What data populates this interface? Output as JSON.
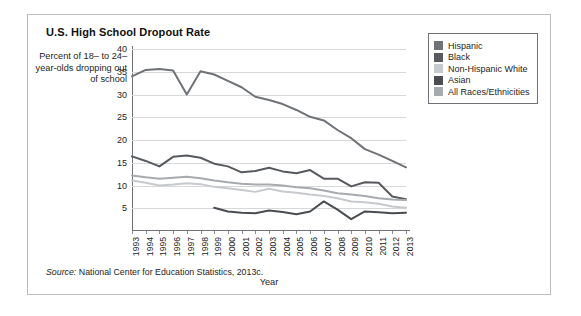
{
  "card": {
    "title": "U.S. High School Dropout Rate",
    "source_prefix": "Source:",
    "source_text": " National Center for Education Statistics, 2013c."
  },
  "chart_data": {
    "type": "line",
    "title": "U.S. High School Dropout Rate",
    "xlabel": "Year",
    "ylabel": "Percent of 18– to 24–year-olds dropping out of school",
    "ylim": [
      0,
      40
    ],
    "yticks": [
      5,
      10,
      15,
      20,
      25,
      30,
      35,
      40
    ],
    "grid": true,
    "legend_position": "right",
    "categories": [
      "1993",
      "1994",
      "1995",
      "1996",
      "1997",
      "1998",
      "1999",
      "2000",
      "2001",
      "2002",
      "2003",
      "2004",
      "2005",
      "2006",
      "2007",
      "2008",
      "2009",
      "2010",
      "2011",
      "2012",
      "2013"
    ],
    "series": [
      {
        "name": "Hispanic",
        "color": "#6f7276",
        "values": [
          34.0,
          35.4,
          35.6,
          35.3,
          30.0,
          35.1,
          34.4,
          33.0,
          31.6,
          29.5,
          28.8,
          27.9,
          26.6,
          25.1,
          24.3,
          22.2,
          20.4,
          18.0,
          16.8,
          15.4,
          14.0
        ]
      },
      {
        "name": "Black",
        "color": "#575a5e",
        "values": [
          16.4,
          15.4,
          14.2,
          16.3,
          16.6,
          16.1,
          14.8,
          14.2,
          12.9,
          13.2,
          13.9,
          13.1,
          12.7,
          13.4,
          11.5,
          11.5,
          9.8,
          10.7,
          10.6,
          7.6,
          7.0
        ]
      },
      {
        "name": "Non-Hispanic White",
        "color": "#c7cacd",
        "values": [
          11.1,
          10.6,
          10.0,
          10.2,
          10.5,
          10.3,
          9.7,
          9.4,
          9.0,
          8.6,
          9.3,
          8.7,
          8.4,
          8.0,
          7.7,
          7.2,
          6.5,
          6.3,
          6.0,
          5.4,
          5.1
        ]
      },
      {
        "name": "Asian",
        "color": "#4a4d51",
        "values": [
          null,
          null,
          null,
          null,
          null,
          null,
          5.1,
          4.3,
          4.0,
          3.9,
          4.5,
          4.2,
          3.7,
          4.3,
          6.5,
          4.7,
          2.6,
          4.3,
          4.1,
          3.9,
          4.0
        ]
      },
      {
        "name": "All Races/Ethnicities",
        "color": "#a7aaae",
        "values": [
          12.2,
          11.8,
          11.5,
          11.7,
          11.9,
          11.6,
          11.1,
          10.7,
          10.4,
          10.2,
          10.2,
          10.0,
          9.6,
          9.4,
          8.9,
          8.3,
          8.0,
          7.7,
          7.2,
          6.9,
          6.8
        ]
      }
    ]
  },
  "legend": {
    "items": [
      {
        "label": "Hispanic",
        "color": "#6f7276"
      },
      {
        "label": "Black",
        "color": "#575a5e"
      },
      {
        "label": "Non-Hispanic White",
        "color": "#c7cacd"
      },
      {
        "label": "Asian",
        "color": "#4a4d51"
      },
      {
        "label": "All Races/Ethnicities",
        "color": "#a7aaae"
      }
    ]
  }
}
